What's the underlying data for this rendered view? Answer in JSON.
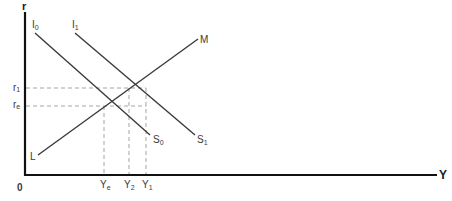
{
  "diagram": {
    "type": "IS-LM / savings-investment macroeconomic diagram",
    "axes": {
      "y_label": "r",
      "x_label": "Y",
      "origin_label": "0"
    },
    "curves": [
      {
        "id": "I0S0",
        "start_label": {
          "base": "I",
          "sub": "0"
        },
        "end_label": {
          "base": "S",
          "sub": "0"
        }
      },
      {
        "id": "I1S1",
        "start_label": {
          "base": "I",
          "sub": "1"
        },
        "end_label": {
          "base": "S",
          "sub": "1"
        }
      },
      {
        "id": "LM",
        "start_label": {
          "base": "L",
          "sub": ""
        },
        "end_label": {
          "base": "M",
          "sub": ""
        }
      }
    ],
    "y_ticks": [
      {
        "base": "r",
        "sub": "1"
      },
      {
        "base": "r",
        "sub": "e"
      }
    ],
    "x_ticks": [
      {
        "base": "Y",
        "sub": "e"
      },
      {
        "base": "Y",
        "sub": "2"
      },
      {
        "base": "Y",
        "sub": "1"
      }
    ]
  },
  "colors": {
    "axis": "#111111",
    "curve": "#3a3a3a",
    "dashed": "#9a9a9a"
  }
}
